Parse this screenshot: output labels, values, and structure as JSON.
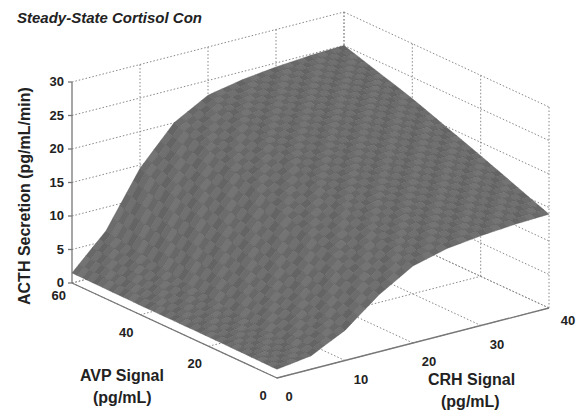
{
  "chart_data": {
    "type": "surface",
    "title": "Steady-State Cortisol Con",
    "xlabel": "CRH Signal\n(pg/mL)",
    "ylabel": "AVP Signal\n(pg/mL)",
    "zlabel": "ACTH Secretion (pg/mL/min)",
    "xlabel_lines": [
      "CRH Signal",
      "(pg/mL)"
    ],
    "ylabel_lines": [
      "AVP Signal",
      "(pg/mL)"
    ],
    "x_axis": {
      "name": "CRH Signal",
      "unit": "pg/mL",
      "range": [
        0,
        40
      ],
      "ticks": [
        0,
        10,
        20,
        30,
        40
      ]
    },
    "y_axis": {
      "name": "AVP Signal",
      "unit": "pg/mL",
      "range": [
        0,
        60
      ],
      "ticks": [
        0,
        20,
        40,
        60
      ]
    },
    "z_axis": {
      "name": "ACTH Secretion",
      "unit": "pg/mL/min",
      "range": [
        0,
        30
      ],
      "ticks": [
        0,
        5,
        10,
        15,
        20,
        25,
        30
      ]
    },
    "grid": true,
    "surface_color": "#6e6e6e",
    "edge_values": {
      "crh0_avp0": 1.3,
      "crh0_avp60": 1.5,
      "crh40_avp0": 14,
      "crh40_avp60": 25
    },
    "surface_samples": {
      "crh": [
        0,
        5,
        10,
        15,
        20,
        25,
        30,
        35,
        40
      ],
      "avp": [
        0,
        20,
        40,
        60
      ],
      "z": [
        [
          1.3,
          2.0,
          4.5,
          8.5,
          11.5,
          12.8,
          13.4,
          13.8,
          14.0
        ],
        [
          1.4,
          3.0,
          7.5,
          12.5,
          15.5,
          16.8,
          17.4,
          17.8,
          18.0
        ],
        [
          1.4,
          4.5,
          11.0,
          16.5,
          19.5,
          20.6,
          21.2,
          21.6,
          21.8
        ],
        [
          1.5,
          6.5,
          14.5,
          20.0,
          22.8,
          23.8,
          24.4,
          24.8,
          25.0
        ]
      ]
    }
  }
}
